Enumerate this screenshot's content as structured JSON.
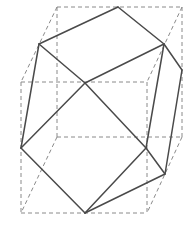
{
  "diagram": {
    "colors": {
      "background": "#ffffff",
      "box_edges": "#8a8a8a",
      "solid_edges": "#4a4a4a"
    },
    "box_vertices": {
      "front_top_left": [
        21,
        82
      ],
      "front_top_right": [
        147,
        82
      ],
      "front_bottom_left": [
        21,
        213
      ],
      "front_bottom_right": [
        147,
        213
      ],
      "back_top_left": [
        57,
        7
      ],
      "back_top_right": [
        182,
        7
      ],
      "back_bottom_left": [
        57,
        137
      ],
      "back_bottom_right": [
        182,
        137
      ]
    },
    "polyhedron_vertices": {
      "top": [
        118,
        7
      ],
      "upper_left": [
        39,
        44
      ],
      "upper_right": [
        164,
        44
      ],
      "center": [
        85,
        83
      ],
      "right_back": [
        182,
        70
      ],
      "left_mid": [
        21,
        148
      ],
      "right_mid": [
        146,
        148
      ],
      "right_low": [
        165,
        174
      ],
      "bottom": [
        85,
        213
      ]
    }
  }
}
